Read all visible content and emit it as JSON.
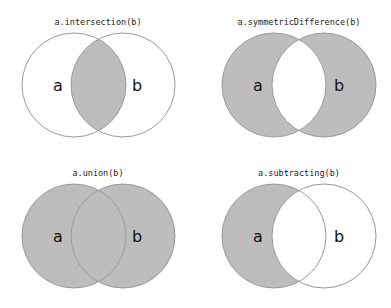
{
  "colors": {
    "background": "#ffffff",
    "fill": "#bdbdbd",
    "stroke": "#9a9a9a",
    "text": "#222222"
  },
  "panels": [
    {
      "title": "a.intersection(b)",
      "label_a": "a",
      "label_b": "b",
      "shaded": "intersection"
    },
    {
      "title": "a.symmetricDifference(b)",
      "label_a": "a",
      "label_b": "b",
      "shaded": "symmetric-difference"
    },
    {
      "title": "a.union(b)",
      "label_a": "a",
      "label_b": "b",
      "shaded": "union"
    },
    {
      "title": "a.subtracting(b)",
      "label_a": "a",
      "label_b": "b",
      "shaded": "a-minus-b"
    }
  ]
}
